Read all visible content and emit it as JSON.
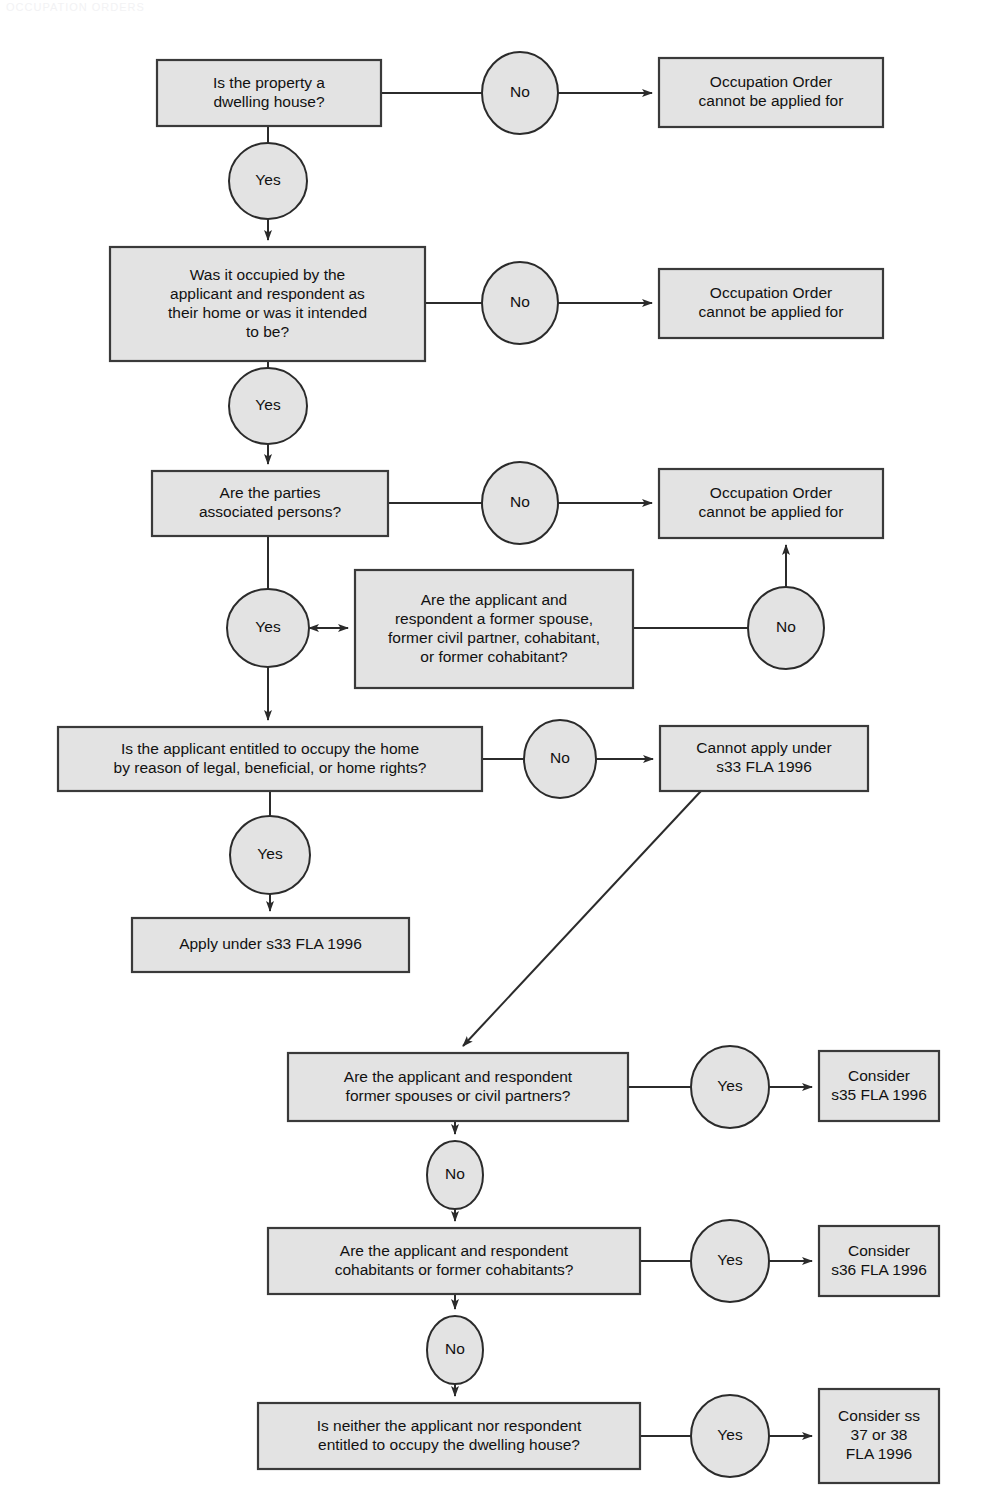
{
  "diagram": {
    "colors": {
      "node_fill": "#e3e3e3",
      "node_stroke": "#3a3a3a",
      "edge_stroke": "#2b2b2b",
      "text": "#111111",
      "background": "#ffffff"
    },
    "nodes": [
      {
        "id": "q1",
        "kind": "box",
        "x": 157,
        "y": 60,
        "w": 224,
        "h": 66,
        "lines": [
          "Is the property a",
          "dwelling house?"
        ]
      },
      {
        "id": "n1",
        "kind": "ellipse",
        "cx": 520,
        "cy": 93,
        "rx": 38,
        "ry": 41,
        "lines": [
          "No"
        ]
      },
      {
        "id": "r1",
        "kind": "box",
        "x": 659,
        "y": 58,
        "w": 224,
        "h": 69,
        "lines": [
          "Occupation Order",
          "cannot be applied for"
        ]
      },
      {
        "id": "y1",
        "kind": "ellipse",
        "cx": 268,
        "cy": 181,
        "rx": 39,
        "ry": 38,
        "lines": [
          "Yes"
        ]
      },
      {
        "id": "q2",
        "kind": "box",
        "x": 110,
        "y": 247,
        "w": 315,
        "h": 114,
        "lines": [
          "Was it occupied by the",
          "applicant and respondent as",
          "their home or was it intended",
          "to be?"
        ]
      },
      {
        "id": "n2",
        "kind": "ellipse",
        "cx": 520,
        "cy": 303,
        "rx": 38,
        "ry": 41,
        "lines": [
          "No"
        ]
      },
      {
        "id": "r2",
        "kind": "box",
        "x": 659,
        "y": 269,
        "w": 224,
        "h": 69,
        "lines": [
          "Occupation Order",
          "cannot be applied for"
        ]
      },
      {
        "id": "y2",
        "kind": "ellipse",
        "cx": 268,
        "cy": 406,
        "rx": 39,
        "ry": 38,
        "lines": [
          "Yes"
        ]
      },
      {
        "id": "q3",
        "kind": "box",
        "x": 152,
        "y": 471,
        "w": 236,
        "h": 65,
        "lines": [
          "Are the parties",
          "associated persons?"
        ]
      },
      {
        "id": "n3",
        "kind": "ellipse",
        "cx": 520,
        "cy": 503,
        "rx": 38,
        "ry": 41,
        "lines": [
          "No"
        ]
      },
      {
        "id": "r3",
        "kind": "box",
        "x": 659,
        "y": 469,
        "w": 224,
        "h": 69,
        "lines": [
          "Occupation Order",
          "cannot be applied for"
        ]
      },
      {
        "id": "y3",
        "kind": "ellipse",
        "cx": 268,
        "cy": 628,
        "rx": 41,
        "ry": 39,
        "lines": [
          "Yes"
        ]
      },
      {
        "id": "q4",
        "kind": "box",
        "x": 355,
        "y": 570,
        "w": 278,
        "h": 118,
        "lines": [
          "Are the applicant and",
          "respondent a former spouse,",
          "former civil partner, cohabitant,",
          "or former cohabitant?"
        ]
      },
      {
        "id": "n4",
        "kind": "ellipse",
        "cx": 786,
        "cy": 628,
        "rx": 38,
        "ry": 41,
        "lines": [
          "No"
        ]
      },
      {
        "id": "q5",
        "kind": "box",
        "x": 58,
        "y": 727,
        "w": 424,
        "h": 64,
        "lines": [
          "Is the applicant entitled to occupy the home",
          "by reason of legal, beneficial, or home rights?"
        ]
      },
      {
        "id": "n5",
        "kind": "ellipse",
        "cx": 560,
        "cy": 759,
        "rx": 36,
        "ry": 39,
        "lines": [
          "No"
        ]
      },
      {
        "id": "r5",
        "kind": "box",
        "x": 660,
        "y": 726,
        "w": 208,
        "h": 65,
        "lines": [
          "Cannot apply under",
          "s33 FLA 1996"
        ]
      },
      {
        "id": "y5",
        "kind": "ellipse",
        "cx": 270,
        "cy": 855,
        "rx": 40,
        "ry": 39,
        "lines": [
          "Yes"
        ]
      },
      {
        "id": "r6",
        "kind": "box",
        "x": 132,
        "y": 918,
        "w": 277,
        "h": 54,
        "lines": [
          "Apply under s33 FLA 1996"
        ]
      },
      {
        "id": "q6",
        "kind": "box",
        "x": 288,
        "y": 1053,
        "w": 340,
        "h": 68,
        "lines": [
          "Are the applicant and respondent",
          "former spouses or civil partners?"
        ]
      },
      {
        "id": "y6",
        "kind": "ellipse",
        "cx": 730,
        "cy": 1087,
        "rx": 39,
        "ry": 41,
        "lines": [
          "Yes"
        ]
      },
      {
        "id": "r7",
        "kind": "box",
        "x": 819,
        "y": 1051,
        "w": 120,
        "h": 70,
        "lines": [
          "Consider",
          "s35 FLA 1996"
        ]
      },
      {
        "id": "n6",
        "kind": "ellipse",
        "cx": 455,
        "cy": 1175,
        "rx": 28,
        "ry": 34,
        "lines": [
          "No"
        ]
      },
      {
        "id": "q7",
        "kind": "box",
        "x": 268,
        "y": 1228,
        "w": 372,
        "h": 66,
        "lines": [
          "Are the applicant and respondent",
          "cohabitants or former cohabitants?"
        ]
      },
      {
        "id": "y7",
        "kind": "ellipse",
        "cx": 730,
        "cy": 1261,
        "rx": 39,
        "ry": 41,
        "lines": [
          "Yes"
        ]
      },
      {
        "id": "r8",
        "kind": "box",
        "x": 819,
        "y": 1226,
        "w": 120,
        "h": 70,
        "lines": [
          "Consider",
          "s36 FLA 1996"
        ]
      },
      {
        "id": "n7",
        "kind": "ellipse",
        "cx": 455,
        "cy": 1350,
        "rx": 28,
        "ry": 34,
        "lines": [
          "No"
        ]
      },
      {
        "id": "q8",
        "kind": "box",
        "x": 258,
        "y": 1403,
        "w": 382,
        "h": 66,
        "lines": [
          "Is neither the applicant nor respondent",
          "entitled to occupy the dwelling house?"
        ]
      },
      {
        "id": "y8",
        "kind": "ellipse",
        "cx": 730,
        "cy": 1436,
        "rx": 39,
        "ry": 41,
        "lines": [
          "Yes"
        ]
      },
      {
        "id": "r9",
        "kind": "box",
        "x": 819,
        "y": 1389,
        "w": 120,
        "h": 94,
        "lines": [
          "Consider ss",
          "37 or 38",
          "FLA 1996"
        ]
      }
    ],
    "edges": [
      {
        "id": "e-q1-n1",
        "from": "q1",
        "to": "n1",
        "label": "No",
        "arrow": false,
        "d": "M 381 93 L 482 93"
      },
      {
        "id": "e-n1-r1",
        "from": "n1",
        "to": "r1",
        "label": "",
        "arrow": true,
        "d": "M 558 93 L 652 93"
      },
      {
        "id": "e-q1-y1",
        "from": "q1",
        "to": "y1",
        "label": "Yes",
        "arrow": false,
        "d": "M 268 126 L 268 143"
      },
      {
        "id": "e-y1-q2",
        "from": "y1",
        "to": "q2",
        "label": "",
        "arrow": true,
        "d": "M 268 219 L 268 240"
      },
      {
        "id": "e-q2-n2",
        "from": "q2",
        "to": "n2",
        "label": "No",
        "arrow": false,
        "d": "M 425 303 L 482 303"
      },
      {
        "id": "e-n2-r2",
        "from": "n2",
        "to": "r2",
        "label": "",
        "arrow": true,
        "d": "M 558 303 L 652 303"
      },
      {
        "id": "e-q2-y2",
        "from": "q2",
        "to": "y2",
        "label": "Yes",
        "arrow": false,
        "d": "M 268 361 L 268 368"
      },
      {
        "id": "e-y2-q3",
        "from": "y2",
        "to": "q3",
        "label": "",
        "arrow": true,
        "d": "M 268 444 L 268 464"
      },
      {
        "id": "e-q3-n3",
        "from": "q3",
        "to": "n3",
        "label": "No",
        "arrow": false,
        "d": "M 388 503 L 482 503"
      },
      {
        "id": "e-n3-r3",
        "from": "n3",
        "to": "r3",
        "label": "",
        "arrow": true,
        "d": "M 558 503 L 652 503"
      },
      {
        "id": "e-q3-y3",
        "from": "q3",
        "to": "y3",
        "label": "Yes",
        "arrow": false,
        "d": "M 268 536 L 268 589"
      },
      {
        "id": "e-y3-q4",
        "from": "y3",
        "to": "q4",
        "label": "",
        "arrow": true,
        "d": "M 309 628 L 348 628"
      },
      {
        "id": "e-q4-y3",
        "from": "q4",
        "to": "y3",
        "label": "",
        "arrow": true,
        "d": "M 348 628 L 309 628"
      },
      {
        "id": "e-q4-n4",
        "from": "q4",
        "to": "n4",
        "label": "No",
        "arrow": false,
        "d": "M 633 628 L 748 628"
      },
      {
        "id": "e-n4-r3",
        "from": "n4",
        "to": "r3",
        "label": "",
        "arrow": true,
        "d": "M 786 587 L 786 545"
      },
      {
        "id": "e-y3-q5",
        "from": "y3",
        "to": "q5",
        "label": "",
        "arrow": true,
        "d": "M 268 667 L 268 720"
      },
      {
        "id": "e-q5-n5",
        "from": "q5",
        "to": "n5",
        "label": "No",
        "arrow": false,
        "d": "M 482 759 L 524 759"
      },
      {
        "id": "e-n5-r5",
        "from": "n5",
        "to": "r5",
        "label": "",
        "arrow": true,
        "d": "M 596 759 L 653 759"
      },
      {
        "id": "e-q5-y5",
        "from": "q5",
        "to": "y5",
        "label": "Yes",
        "arrow": false,
        "d": "M 270 791 L 270 816"
      },
      {
        "id": "e-y5-r6",
        "from": "y5",
        "to": "r6",
        "label": "",
        "arrow": true,
        "d": "M 270 894 L 270 911"
      },
      {
        "id": "e-r5-q6",
        "from": "r5",
        "to": "q6",
        "label": "",
        "arrow": true,
        "d": "M 701 791 L 463 1046"
      },
      {
        "id": "e-q6-y6",
        "from": "q6",
        "to": "y6",
        "label": "Yes",
        "arrow": false,
        "d": "M 628 1087 L 691 1087"
      },
      {
        "id": "e-y6-r7",
        "from": "y6",
        "to": "r7",
        "label": "",
        "arrow": true,
        "d": "M 769 1087 L 812 1087"
      },
      {
        "id": "e-q6-n6",
        "from": "q6",
        "to": "n6",
        "label": "No",
        "arrow": true,
        "d": "M 455 1121 L 455 1134"
      },
      {
        "id": "e-n6-q7",
        "from": "n6",
        "to": "q7",
        "label": "",
        "arrow": true,
        "d": "M 455 1209 L 455 1221"
      },
      {
        "id": "e-q7-y7",
        "from": "q7",
        "to": "y7",
        "label": "Yes",
        "arrow": false,
        "d": "M 640 1261 L 691 1261"
      },
      {
        "id": "e-y7-r8",
        "from": "y7",
        "to": "r8",
        "label": "",
        "arrow": true,
        "d": "M 769 1261 L 812 1261"
      },
      {
        "id": "e-q7-n7",
        "from": "q7",
        "to": "n7",
        "label": "No",
        "arrow": true,
        "d": "M 455 1294 L 455 1309"
      },
      {
        "id": "e-n7-q8",
        "from": "n7",
        "to": "q8",
        "label": "",
        "arrow": true,
        "d": "M 455 1384 L 455 1396"
      },
      {
        "id": "e-q8-y8",
        "from": "q8",
        "to": "y8",
        "label": "Yes",
        "arrow": false,
        "d": "M 640 1436 L 691 1436"
      },
      {
        "id": "e-y8-r9",
        "from": "y8",
        "to": "r9",
        "label": "",
        "arrow": true,
        "d": "M 769 1436 L 812 1436"
      }
    ]
  },
  "page": {
    "top_artifact": "OCCUPATION ORDERS"
  }
}
